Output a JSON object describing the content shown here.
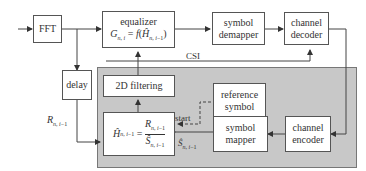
{
  "blocks": {
    "fft": "FFT",
    "equalizer_title": "equalizer",
    "equalizer_formula": "G_{n,i} = f(Ĥ_{n,i−1})",
    "symbol_demapper": [
      "symbol",
      "demapper"
    ],
    "channel_decoder": [
      "channel",
      "decoder"
    ],
    "delay": "delay",
    "filtering": "2D filtering",
    "reference_symbol": [
      "reference",
      "symbol"
    ],
    "estimator_formula": "Ĥ_{n,i−1} = R_{n,i−1} / Ŝ_{n,i−1}",
    "symbol_mapper": [
      "symbol",
      "mapper"
    ],
    "channel_encoder": [
      "channel",
      "encoder"
    ]
  },
  "labels": {
    "csi": "CSI",
    "start": "start",
    "r_input": "R_{n,i−1}",
    "s_hat": "Ŝ_{n,i−1}"
  }
}
